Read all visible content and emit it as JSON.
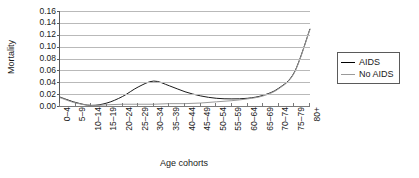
{
  "chart_data": {
    "type": "line",
    "title": "",
    "xlabel": "Age cohorts",
    "ylabel": "Mortality",
    "ylim": [
      0.0,
      0.16
    ],
    "ytick_step": 0.02,
    "yticks": [
      "0.00",
      "0.02",
      "0.04",
      "0.06",
      "0.08",
      "0.10",
      "0.12",
      "0.14",
      "0.16"
    ],
    "grid": true,
    "legend_position": "right",
    "categories": [
      "0–4",
      "5–9",
      "10–14",
      "15–19",
      "20–24",
      "25–29",
      "30–34",
      "35–39",
      "40–44",
      "45–49",
      "50–54",
      "55–59",
      "60–64",
      "65–69",
      "70–74",
      "75–79",
      "80+"
    ],
    "series": [
      {
        "name": "AIDS",
        "color": "#1a1a1a",
        "values": [
          0.015,
          0.006,
          0.001,
          0.005,
          0.016,
          0.032,
          0.042,
          0.034,
          0.024,
          0.017,
          0.013,
          0.012,
          0.013,
          0.018,
          0.03,
          0.057,
          0.13
        ]
      },
      {
        "name": "No AIDS",
        "color": "#9a9a9a",
        "values": [
          0.014,
          0.005,
          0.001,
          0.002,
          0.003,
          0.003,
          0.003,
          0.004,
          0.004,
          0.005,
          0.007,
          0.009,
          0.012,
          0.017,
          0.029,
          0.056,
          0.129
        ]
      }
    ]
  },
  "legend": {
    "items": [
      {
        "label": "AIDS"
      },
      {
        "label": "No AIDS"
      }
    ]
  }
}
